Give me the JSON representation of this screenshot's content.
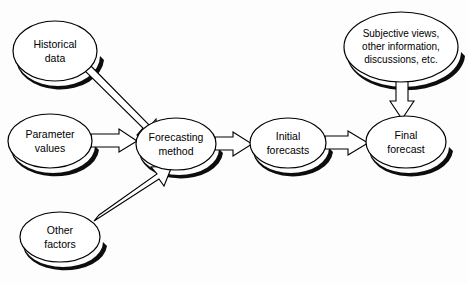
{
  "diagram": {
    "background_color": "#fdfdfd",
    "node_fill_color": "#ffffff",
    "node_stroke_color": "#000000",
    "shadow_color": "#0d0d0d",
    "arrow_fill_color": "#ffffff",
    "arrow_stroke_color": "#000000",
    "nodes": [
      {
        "id": "historical-data",
        "shape": "ellipse",
        "lines": [
          "Historical",
          "data"
        ],
        "line1": "Historical",
        "line2": "data",
        "cx": 55,
        "cy": 51,
        "rx": 42,
        "ry": 30
      },
      {
        "id": "parameter-values",
        "shape": "ellipse",
        "lines": [
          "Parameter",
          "values"
        ],
        "line1": "Parameter",
        "line2": "values",
        "cx": 50,
        "cy": 141,
        "rx": 42,
        "ry": 27
      },
      {
        "id": "other-factors",
        "shape": "ellipse",
        "lines": [
          "Other",
          "factors"
        ],
        "line1": "Other",
        "line2": "factors",
        "cx": 60,
        "cy": 237,
        "rx": 40,
        "ry": 25
      },
      {
        "id": "forecasting-method",
        "shape": "ellipse",
        "lines": [
          "Forecasting",
          "method"
        ],
        "line1": "Forecasting",
        "line2": "method",
        "cx": 176,
        "cy": 144,
        "rx": 40,
        "ry": 26
      },
      {
        "id": "initial-forecasts",
        "shape": "ellipse",
        "lines": [
          "Initial",
          "forecasts"
        ],
        "line1": "Initial",
        "line2": "forecasts",
        "cx": 288,
        "cy": 143,
        "rx": 38,
        "ry": 25
      },
      {
        "id": "final-forecast",
        "shape": "ellipse",
        "lines": [
          "Final",
          "forecast"
        ],
        "line1": "Final",
        "line2": "forecast",
        "cx": 406,
        "cy": 142,
        "rx": 40,
        "ry": 26
      },
      {
        "id": "subjective-views",
        "shape": "ellipse",
        "lines": [
          "Subjective views,",
          "other information,",
          "discussions, etc."
        ],
        "line1": "Subjective views,",
        "line2": "other information,",
        "line3": "discussions, etc.",
        "cx": 401,
        "cy": 47,
        "rx": 57,
        "ry": 35
      }
    ],
    "edges": [
      {
        "id": "edge-historical-to-method",
        "from": "historical-data",
        "to": "forecasting-method",
        "style": "hollow-block-arrow",
        "direction": "diagonal-down-right"
      },
      {
        "id": "edge-parameter-to-method",
        "from": "parameter-values",
        "to": "forecasting-method",
        "style": "hollow-block-arrow",
        "direction": "right"
      },
      {
        "id": "edge-other-to-method",
        "from": "other-factors",
        "to": "forecasting-method",
        "style": "hollow-block-arrow",
        "direction": "diagonal-up-right"
      },
      {
        "id": "edge-method-to-initial",
        "from": "forecasting-method",
        "to": "initial-forecasts",
        "style": "hollow-block-arrow",
        "direction": "right"
      },
      {
        "id": "edge-initial-to-final",
        "from": "initial-forecasts",
        "to": "final-forecast",
        "style": "hollow-block-arrow",
        "direction": "right"
      },
      {
        "id": "edge-subjective-to-final",
        "from": "subjective-views",
        "to": "final-forecast",
        "style": "hollow-block-arrow",
        "direction": "down"
      }
    ]
  }
}
